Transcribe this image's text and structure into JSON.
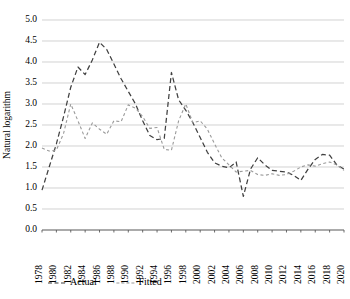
{
  "chart_data": {
    "type": "line",
    "title": "",
    "xlabel": "",
    "ylabel": "Natural logarithm",
    "ylim": [
      0.0,
      5.0
    ],
    "xlim": [
      1978,
      2020
    ],
    "grid": true,
    "legend_position": "bottom-left",
    "y_ticks": [
      "0.0",
      "0.5",
      "1.0",
      "1.5",
      "2.0",
      "2.5",
      "3.0",
      "3.5",
      "4.0",
      "4.5",
      "5.0"
    ],
    "x_ticks": [
      "1978",
      "1980",
      "1982",
      "1984",
      "1986",
      "1988",
      "1990",
      "1992",
      "1994",
      "1996",
      "1998",
      "2000",
      "2002",
      "2004",
      "2006",
      "2008",
      "2010",
      "2012",
      "2014",
      "2016",
      "2018",
      "2020"
    ],
    "x": [
      1978,
      1979,
      1980,
      1981,
      1982,
      1983,
      1984,
      1985,
      1986,
      1987,
      1988,
      1989,
      1990,
      1991,
      1992,
      1993,
      1994,
      1995,
      1996,
      1997,
      1998,
      1999,
      2000,
      2001,
      2002,
      2003,
      2004,
      2005,
      2006,
      2007,
      2008,
      2009,
      2010,
      2011,
      2012,
      2013,
      2014,
      2015,
      2016,
      2017,
      2018,
      2019,
      2020
    ],
    "series": [
      {
        "name": "Actual",
        "color": "#404040",
        "dash": "5,3",
        "width": 1.25,
        "values": [
          0.95,
          1.5,
          2.05,
          2.7,
          3.4,
          3.88,
          3.7,
          4.05,
          4.47,
          4.3,
          3.95,
          3.6,
          3.3,
          3.0,
          2.6,
          2.25,
          2.15,
          2.18,
          3.75,
          3.1,
          2.85,
          2.55,
          2.2,
          1.85,
          1.6,
          1.52,
          1.48,
          1.62,
          0.8,
          1.45,
          1.72,
          1.55,
          1.42,
          1.4,
          1.38,
          1.3,
          1.18,
          1.45,
          1.68,
          1.8,
          1.78,
          1.55,
          1.45
        ]
      },
      {
        "name": "Fitted",
        "color": "#9a9a9a",
        "dash": "3,2.5",
        "width": 1.1,
        "values": [
          1.95,
          1.88,
          1.9,
          2.3,
          3.0,
          2.6,
          2.18,
          2.55,
          2.4,
          2.28,
          2.6,
          2.58,
          2.98,
          2.9,
          2.7,
          2.42,
          2.44,
          1.92,
          1.9,
          2.6,
          3.0,
          2.55,
          2.6,
          2.4,
          2.05,
          1.72,
          1.55,
          1.38,
          1.4,
          1.42,
          1.32,
          1.3,
          1.34,
          1.3,
          1.32,
          1.4,
          1.5,
          1.55,
          1.52,
          1.58,
          1.62,
          1.55,
          1.42
        ]
      }
    ],
    "legend": [
      {
        "label": "Actual",
        "color": "#404040",
        "dash": "4,2.5"
      },
      {
        "label": "Fitted",
        "color": "#9a9a9a",
        "dash": "3,2"
      }
    ]
  },
  "plot": {
    "left": 42,
    "right": 344,
    "top": 20,
    "bottom": 230
  }
}
